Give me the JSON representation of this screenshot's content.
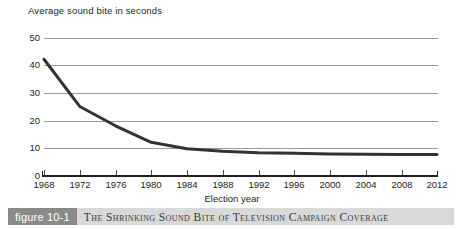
{
  "figure": {
    "badge_label": "figure 10-1",
    "caption": "The Shrinking Sound Bite of Television Campaign Coverage"
  },
  "chart_data": {
    "type": "line",
    "title": "Average sound bite in seconds",
    "xlabel": "Election year",
    "ylabel": "Average sound bite in seconds",
    "grid": true,
    "legend": "none",
    "xlim": [
      1968,
      2012
    ],
    "ylim": [
      0,
      50
    ],
    "ytick_labels": [
      "0",
      "10",
      "20",
      "30",
      "40",
      "50"
    ],
    "yticks": [
      0,
      10,
      20,
      30,
      40,
      50
    ],
    "xtick_labels": [
      "1968",
      "1972",
      "1976",
      "1980",
      "1984",
      "1988",
      "1992",
      "1996",
      "2000",
      "2004",
      "2008",
      "2012"
    ],
    "xticks": [
      1968,
      1972,
      1976,
      1980,
      1984,
      1988,
      1992,
      1996,
      2000,
      2004,
      2008,
      2012
    ],
    "x": [
      1968,
      1972,
      1976,
      1980,
      1984,
      1988,
      1992,
      1996,
      2000,
      2004,
      2008,
      2012
    ],
    "values": [
      42.3,
      25.2,
      18.2,
      12.2,
      9.9,
      9.0,
      8.4,
      8.2,
      8.0,
      7.9,
      7.8,
      7.8
    ],
    "series": [
      {
        "name": "Average sound bite in seconds",
        "color": "#333333",
        "values": [
          42.3,
          25.2,
          18.2,
          12.2,
          9.9,
          9.0,
          8.4,
          8.2,
          8.0,
          7.9,
          7.8,
          7.8
        ]
      }
    ],
    "colors": {
      "line": "#333333",
      "grid": "#9a9a9a",
      "axis": "#231f20",
      "text": "#231f20"
    }
  }
}
